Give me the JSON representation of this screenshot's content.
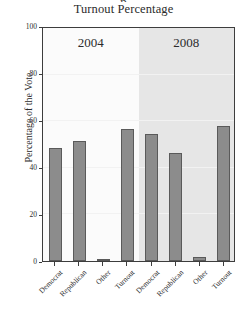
{
  "figure": {
    "clipped_title_fragment": "p",
    "title": "Turnout Percentage"
  },
  "axes": {
    "y_title": "Percentage of the Vote",
    "y_ticks": [
      "0",
      "20",
      "40",
      "60",
      "80",
      "100"
    ]
  },
  "panels": [
    {
      "label": "2004",
      "background": "#fbfbfb"
    },
    {
      "label": "2008",
      "background": "#e6e6e6"
    }
  ],
  "colors": {
    "bar_fill": "#8c8c8c",
    "bar_stroke": "#5a5a5a",
    "frame": "#3d3d3d",
    "grid": "#f2f2f2",
    "panel_left_bg": "#fbfbfb",
    "panel_right_bg": "#e6e6e6"
  },
  "chart_data": {
    "type": "bar",
    "title": "Turnout Percentage",
    "xlabel": "",
    "ylabel": "Percentage of the Vote",
    "ylim": [
      0,
      100
    ],
    "yticks": [
      0,
      20,
      40,
      60,
      80,
      100
    ],
    "grid": true,
    "legend": "none",
    "facets": [
      "2004",
      "2008"
    ],
    "categories": [
      "Democrat",
      "Republican",
      "Other",
      "Turnout"
    ],
    "series": [
      {
        "name": "2004",
        "values": [
          48,
          51,
          1,
          56
        ]
      },
      {
        "name": "2008",
        "values": [
          54,
          46,
          1.5,
          57.5
        ]
      }
    ]
  }
}
